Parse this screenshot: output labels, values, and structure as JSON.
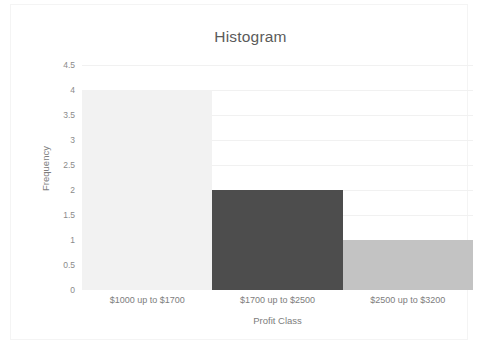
{
  "chart_data": {
    "type": "bar",
    "title": "Histogram",
    "xlabel": "Profit Class",
    "ylabel": "Frequency",
    "categories": [
      "$1000 up to $1700",
      "$1700 up to $2500",
      "$2500 up to $3200"
    ],
    "values": [
      4,
      2,
      1
    ],
    "ylim": [
      0,
      4.5
    ],
    "ytick_labels": [
      "4.5",
      "4",
      "3.5",
      "3",
      "2.5",
      "2",
      "1.5",
      "1",
      "0.5",
      "0"
    ],
    "ytick_values": [
      4.5,
      4,
      3.5,
      3,
      2.5,
      2,
      1.5,
      1,
      0.5,
      0
    ],
    "grid": true,
    "legend": "none",
    "bar_colors": [
      "#f2f2f2",
      "#4d4d4d",
      "#c3c3c3"
    ],
    "gridline_color": "#f1f1f1",
    "axis_text_color": "#7d7d7d",
    "title_color": "#5b5b5b"
  }
}
